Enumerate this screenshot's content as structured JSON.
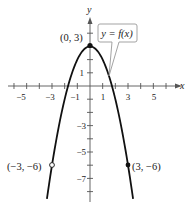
{
  "chart_data": {
    "type": "line",
    "title": "",
    "function": "y = f(x)",
    "xlabel": "x",
    "ylabel": "y",
    "xlim": [
      -6,
      7
    ],
    "ylim": [
      -8.6,
      4.9
    ],
    "grid": false,
    "x_ticks": [
      -6,
      -5,
      -4,
      -3,
      -2,
      -1,
      1,
      2,
      3,
      4,
      5,
      6
    ],
    "x_tick_labels": [
      "-5",
      "-3",
      "-1",
      "1",
      "3",
      "5"
    ],
    "x_tick_label_values": [
      -5,
      -3,
      -1,
      1,
      3,
      5
    ],
    "y_ticks": [
      -8,
      -7,
      -6,
      -5,
      -4,
      -3,
      -2,
      -1,
      1,
      2,
      3,
      4
    ],
    "y_tick_labels": [
      "1",
      "-3",
      "-5",
      "-7"
    ],
    "y_tick_label_values": [
      1,
      -3,
      -5,
      -7
    ],
    "series": [
      {
        "name": "y = f(x)",
        "x": [
          -3.4,
          -3,
          -2.5,
          -2,
          -1.5,
          -1,
          -0.5,
          0,
          0.5,
          1,
          1.5,
          2,
          2.5,
          3,
          3.4
        ],
        "y": [
          -8.56,
          -6,
          -3.25,
          -1,
          0.75,
          2,
          2.75,
          3,
          2.75,
          2,
          0.75,
          -1,
          -3.25,
          -6,
          -8.56
        ]
      }
    ],
    "annotations": [
      {
        "label": "(0, 3)",
        "x": 0,
        "y": 3,
        "marker": "filled"
      },
      {
        "label": "(−3, −6)",
        "x": -3,
        "y": -6,
        "marker": "open"
      },
      {
        "label": "(3, −6)",
        "x": 3,
        "y": -6,
        "marker": "filled"
      }
    ],
    "callout": "y = f(x)"
  },
  "labels": {
    "x_axis": "x",
    "y_axis": "y",
    "callout": "y = f(x)",
    "point_top": "(0, 3)",
    "point_left": "(−3, −6)",
    "point_right": "(3, −6)",
    "xt": [
      "−5",
      "−3",
      "−1",
      "1",
      "3",
      "5"
    ],
    "yt": [
      "1",
      "−3",
      "−5",
      "−7"
    ]
  }
}
